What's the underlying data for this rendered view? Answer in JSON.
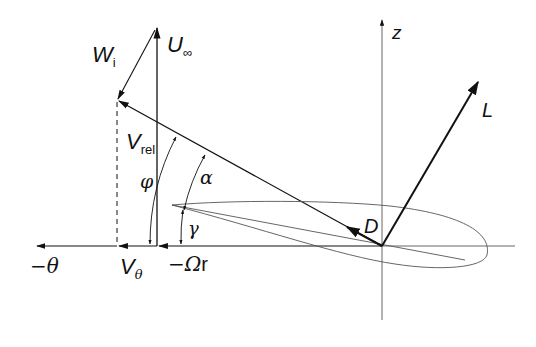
{
  "diagram": {
    "labels": {
      "wi": {
        "main": "W",
        "sub": "i"
      },
      "u_inf": {
        "main": "U",
        "sub": "∞"
      },
      "v_rel": {
        "main": "V",
        "sub": "rel"
      },
      "phi": "φ",
      "alpha": "α",
      "gamma": "γ",
      "neg_theta": "−θ",
      "v_theta": {
        "main": "V",
        "sub": "θ"
      },
      "neg_omega_r": {
        "main": "−Ω",
        "sub": "r"
      },
      "z": "z",
      "lift": "L",
      "drag": "D"
    },
    "vectors": [
      {
        "name": "U_inf",
        "from": [
          157,
          246
        ],
        "to": [
          157,
          28
        ]
      },
      {
        "name": "W_i",
        "from": [
          155,
          28
        ],
        "to": [
          117,
          100
        ]
      },
      {
        "name": "V_rel",
        "from": [
          382,
          246
        ],
        "to": [
          117,
          100
        ]
      },
      {
        "name": "V_theta",
        "from": [
          157,
          246
        ],
        "to": [
          117,
          246
        ]
      },
      {
        "name": "-Omega_r",
        "from": [
          382,
          246
        ],
        "to": [
          157,
          246
        ]
      },
      {
        "name": "-theta_axis",
        "from": [
          117,
          246
        ],
        "to": [
          35,
          246
        ]
      },
      {
        "name": "L",
        "from": [
          382,
          246
        ],
        "to": [
          479,
          80
        ]
      },
      {
        "name": "D",
        "from": [
          382,
          246
        ],
        "to": [
          345,
          226
        ]
      }
    ],
    "colors": {
      "ink": "#111111",
      "thin": "#555555"
    }
  }
}
